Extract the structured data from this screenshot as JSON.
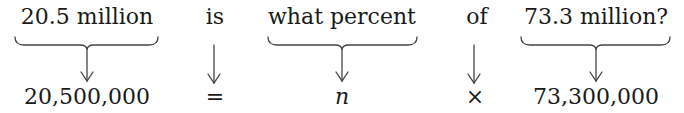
{
  "equation": {
    "words": [
      {
        "text": "20.5 million",
        "x": 87,
        "braced": true,
        "brace_left": 15,
        "brace_right": 158
      },
      {
        "text": "is",
        "x": 215,
        "braced": false
      },
      {
        "text": "what percent",
        "x": 342,
        "braced": true,
        "brace_left": 268,
        "brace_right": 417
      },
      {
        "text": "of",
        "x": 477,
        "braced": false
      },
      {
        "text": "73.3 million?",
        "x": 596,
        "braced": true,
        "brace_left": 521,
        "brace_right": 670
      }
    ],
    "translations": [
      {
        "text": "20,500,000",
        "x": 87,
        "italic": false
      },
      {
        "text": "=",
        "x": 215,
        "italic": false
      },
      {
        "text": "n",
        "x": 342,
        "italic": true
      },
      {
        "text": "×",
        "x": 477,
        "italic": false
      },
      {
        "text": "73,300,000",
        "x": 596,
        "italic": false
      }
    ]
  },
  "colors": {
    "ink": "#1a1a1a",
    "arrow": "#444444",
    "background": "#ffffff"
  }
}
